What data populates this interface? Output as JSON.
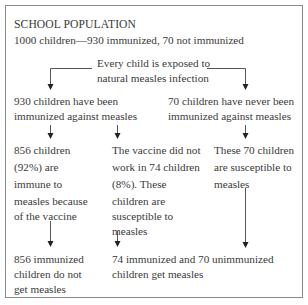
{
  "header": {
    "title": "SCHOOL POPULATION",
    "subtitle": "1000 children—930 immunized, 70 not immunized"
  },
  "exposure": {
    "line1": "Every child is exposed to",
    "line2": "natural measles infection"
  },
  "immunized": {
    "line1": "930 children have been",
    "line2": "immunized against measles"
  },
  "not_immunized": {
    "line1": "70 children have never been",
    "line2": "immunized against measles"
  },
  "immune": {
    "line1": "856 children",
    "line2": "(92%) are",
    "line3": "immune to",
    "line4": "measles because",
    "line5": "of the vaccine"
  },
  "vaccine_failed": {
    "line1": "The vaccine did not",
    "line2": "work in 74 children",
    "line3": "(8%). These",
    "line4": "children are",
    "line5": "susceptible to",
    "line6": "measles"
  },
  "susceptible": {
    "line1": "These 70 children",
    "line2": "are susceptible to",
    "line3": "measles"
  },
  "outcome_protected": {
    "line1": "856 immunized",
    "line2": "children do not",
    "line3": "get measles"
  },
  "outcome_infected": {
    "line1": "74 immunized and 70 unimmunized",
    "line2": "children get measles"
  },
  "colors": {
    "text": "#3a3a3a",
    "border": "#8a8a8a",
    "arrow": "#333333"
  }
}
